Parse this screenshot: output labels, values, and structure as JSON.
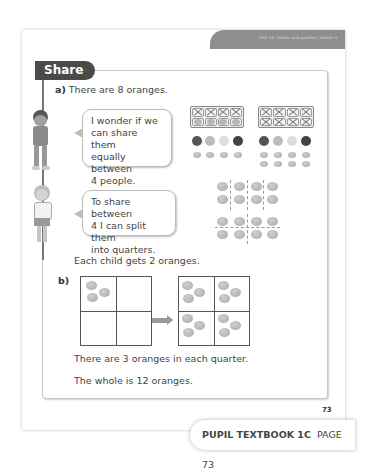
{
  "header": {
    "unit_lesson": "Unit 14: Halves and quarters, Lesson 4"
  },
  "section": {
    "title": "Share"
  },
  "part_a": {
    "label": "a)",
    "statement": "There are 8 oranges.",
    "bubble1": [
      "I wonder if we",
      "can share them",
      "equally between",
      "4 people."
    ],
    "bubble2": [
      "To share between",
      "4 I can split them",
      "into quarters."
    ],
    "conclusion": "Each child gets 2 oranges."
  },
  "part_b": {
    "label": "b)",
    "line1": "There are 3 oranges in each quarter.",
    "line2": "The whole is 12 oranges."
  },
  "page_number": "73",
  "footer": {
    "book": "PUPIL TEXTBOOK 1C",
    "page": "PAGE 73"
  }
}
